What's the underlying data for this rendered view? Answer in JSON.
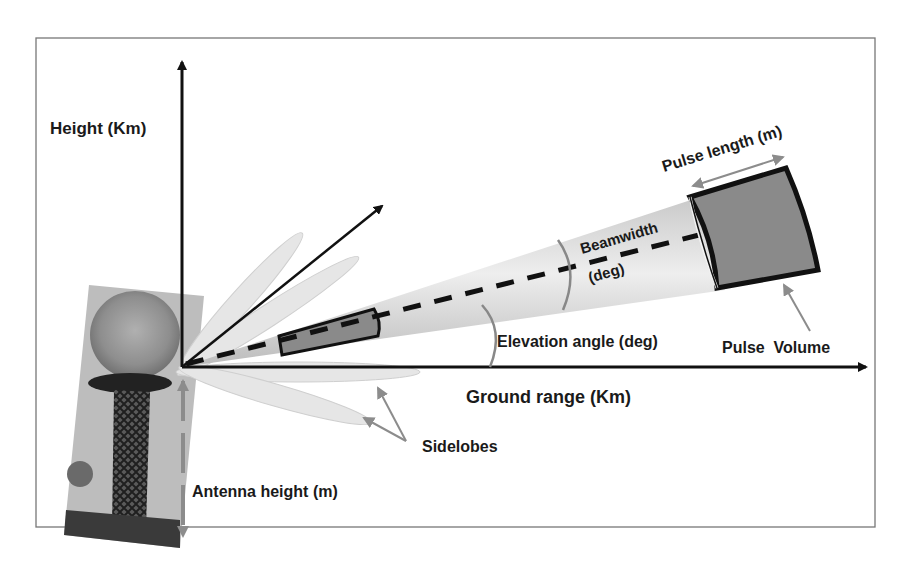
{
  "figure": {
    "colors": {
      "frame": "#777777",
      "axis": "#111111",
      "beam_fill": "#dcdcdc",
      "lobe_fill": "#e6e6e6",
      "pulse_fill": "#8a8a8a",
      "annotation_arrow": "#8c8c8c"
    },
    "axes": {
      "y_label": "Height (Km)",
      "x_label": "Ground range (Km)"
    },
    "labels": {
      "pulse_length": "Pulse length (m)",
      "beamwidth_line1": "Beamwidth",
      "beamwidth_line2": "(deg)",
      "elevation_angle": "Elevation angle (deg)",
      "pulse_volume": "Pulse  Volume",
      "sidelobes": "Sidelobes",
      "antenna_height": "Antenna height (m)"
    },
    "photo": {
      "description": "radar-tower-photo"
    }
  }
}
